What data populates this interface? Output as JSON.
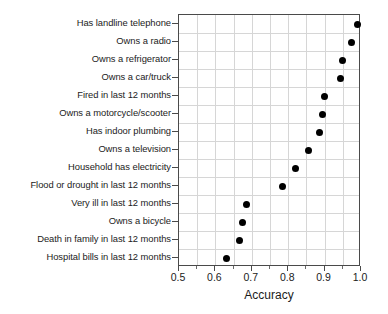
{
  "chart_data": {
    "type": "scatter",
    "title": "",
    "xlabel": "Accuracy",
    "ylabel": "",
    "xlim": [
      0.5,
      1.0
    ],
    "xticks": [
      0.5,
      0.6,
      0.7,
      0.8,
      0.9,
      1.0
    ],
    "xticklabels": [
      "0.5",
      "0.6",
      "0.7",
      "0.8",
      "0.9",
      "1.0"
    ],
    "minor_xticks": [
      0.55,
      0.65,
      0.75,
      0.85,
      0.95
    ],
    "grid": true,
    "legend": "none",
    "marker": "filled-circle",
    "marker_color": "#000000",
    "categories": [
      "Has landline telephone",
      "Owns a radio",
      "Owns a refrigerator",
      "Owns a car/truck",
      "Fired in last 12 months",
      "Owns a motorcycle/scooter",
      "Has indoor plumbing",
      "Owns a television",
      "Household has electricity",
      "Flood or drought in last 12 months",
      "Very ill in last 12 months",
      "Owns a bicycle",
      "Death in family in last 12 months",
      "Hospital bills in last 12 months"
    ],
    "values": [
      0.99,
      0.975,
      0.95,
      0.945,
      0.9,
      0.895,
      0.885,
      0.855,
      0.82,
      0.785,
      0.685,
      0.675,
      0.665,
      0.63
    ]
  }
}
